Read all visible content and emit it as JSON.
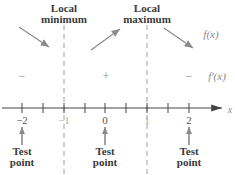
{
  "diagram": {
    "critical_labels": [
      {
        "line1": "Local",
        "line2": "minimum",
        "x": -1
      },
      {
        "line1": "Local",
        "line2": "maximum",
        "x": 1
      }
    ],
    "function_label": "f(x)",
    "derivative_label": "f′(x)",
    "signs": [
      "−",
      "+",
      "−"
    ],
    "axis_label": "x",
    "ticks": [
      "−2",
      "−1",
      "0",
      "1",
      "2"
    ],
    "test_points": [
      {
        "line1": "Test",
        "line2": "point",
        "x": -2
      },
      {
        "line1": "Test",
        "line2": "point",
        "x": 0
      },
      {
        "line1": "Test",
        "line2": "point",
        "x": 2
      }
    ],
    "colors": {
      "arrow": "#8a8a8a",
      "axis": "#444444",
      "dashed": "#a0a0a0",
      "dark_text": "#3a3a3a"
    }
  }
}
